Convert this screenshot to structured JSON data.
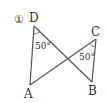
{
  "figure": {
    "number_label": "①",
    "points": {
      "A": {
        "label": "A",
        "x": 30,
        "y": 85
      },
      "B": {
        "label": "B",
        "x": 92,
        "y": 82
      },
      "C": {
        "label": "C",
        "x": 96,
        "y": 39
      },
      "D": {
        "label": "D",
        "x": 34,
        "y": 26
      }
    },
    "angles": {
      "D": {
        "label": "50°"
      },
      "C": {
        "label": "50°"
      }
    },
    "line_color": "#555555"
  }
}
